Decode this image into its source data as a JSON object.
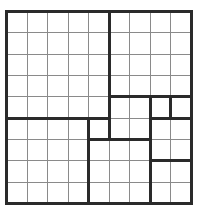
{
  "puzzle": {
    "rows": 9,
    "cols": 9,
    "origin": [
      6,
      11
    ],
    "cell_w": 20.56,
    "cell_h": 21.33,
    "colors": {
      "background": "#ffffff",
      "thin_line": "#8a8a8a",
      "thick_line": "#2a2a2a"
    },
    "cells_values": [],
    "region_borders": [
      {
        "orientation": "v",
        "col": 5,
        "from_row": 0,
        "to_row": 5
      },
      {
        "orientation": "h",
        "row": 4,
        "from_col": 5,
        "to_col": 9
      },
      {
        "orientation": "h",
        "row": 5,
        "from_col": 0,
        "to_col": 5
      },
      {
        "orientation": "v",
        "col": 7,
        "from_row": 4,
        "to_row": 9
      },
      {
        "orientation": "v",
        "col": 8,
        "from_row": 4,
        "to_row": 5
      },
      {
        "orientation": "h",
        "row": 5,
        "from_col": 7,
        "to_col": 9
      },
      {
        "orientation": "v",
        "col": 4,
        "from_row": 5,
        "to_row": 9
      },
      {
        "orientation": "v",
        "col": 5,
        "from_row": 5,
        "to_row": 6
      },
      {
        "orientation": "h",
        "row": 6,
        "from_col": 4,
        "to_col": 7
      },
      {
        "orientation": "h",
        "row": 7,
        "from_col": 7,
        "to_col": 9
      }
    ]
  }
}
